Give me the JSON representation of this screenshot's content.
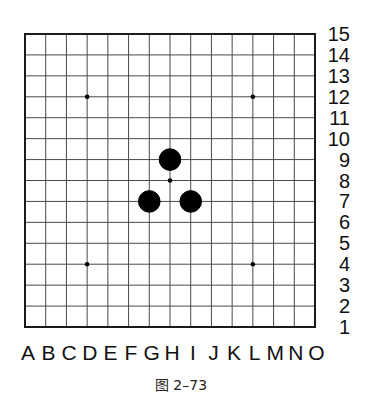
{
  "board": {
    "size": 15,
    "columns": [
      "A",
      "B",
      "C",
      "D",
      "E",
      "F",
      "G",
      "H",
      "I",
      "J",
      "K",
      "L",
      "M",
      "N",
      "O"
    ],
    "rows": [
      "15",
      "14",
      "13",
      "12",
      "11",
      "10",
      "9",
      "8",
      "7",
      "6",
      "5",
      "4",
      "3",
      "2",
      "1"
    ],
    "star_points": [
      "D12",
      "L12",
      "H8",
      "D4",
      "L4"
    ],
    "stones": [
      {
        "color": "black",
        "position": "H9"
      },
      {
        "color": "black",
        "position": "G7"
      },
      {
        "color": "black",
        "position": "I7"
      }
    ],
    "colors": {
      "background": "#ffffff",
      "grid_line": "#4a4a4a",
      "border": "#1a1a1a",
      "stone_black": "#000000"
    }
  },
  "caption": "图 2–73"
}
